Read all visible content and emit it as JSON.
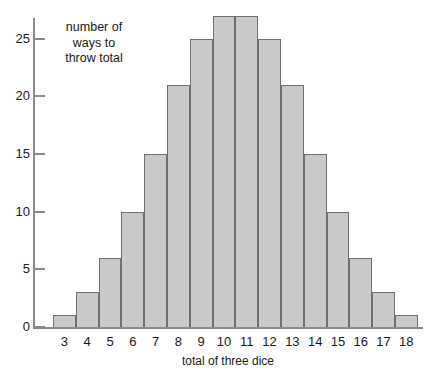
{
  "chart_data": {
    "type": "bar",
    "title": "",
    "subtitle": "",
    "xlabel": "total of three dice",
    "ylabel": "number of ways to throw total",
    "ylabel_lines": [
      "number of",
      "ways to",
      "throw total"
    ],
    "categories": [
      "3",
      "4",
      "5",
      "6",
      "7",
      "8",
      "9",
      "10",
      "11",
      "12",
      "13",
      "14",
      "15",
      "16",
      "17",
      "18"
    ],
    "values": [
      1,
      3,
      6,
      10,
      15,
      21,
      25,
      27,
      27,
      25,
      21,
      15,
      10,
      6,
      3,
      1
    ],
    "ylim": [
      0,
      29
    ],
    "yticks": [
      0,
      5,
      10,
      15,
      20,
      25
    ],
    "ytick_labels": [
      "0",
      "5",
      "10",
      "15",
      "20",
      "25"
    ],
    "grid": false,
    "legend": false,
    "legend_position": "none",
    "bar_fill_color": "#c9c9c9",
    "bar_border_color": "#6f6f6f",
    "axis_color": "#8a8a8a",
    "text_color": "#1a1a1a",
    "background_color": "#ffffff"
  }
}
